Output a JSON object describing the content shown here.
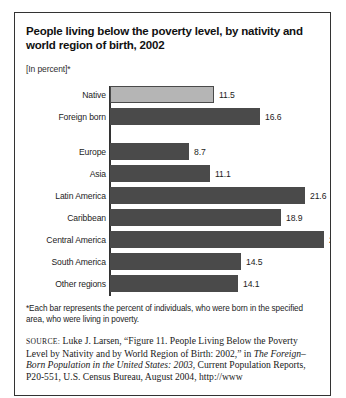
{
  "figure": {
    "title": "People living below the poverty level, by nativity and world region of birth, 2002",
    "subtitle": "[In percent]*",
    "footnote": "*Each bar represents the percent of individuals, who were born in the specified area, who were living in poverty.",
    "source": {
      "label": "SOURCE:",
      "part1": " Luke J. Larsen, “Figure 11. People Living Below the Poverty Level by Nativity and by World Region of Birth: 2002,” in ",
      "italic1": "The Foreign–Born Population in the United States: 2003",
      "part2": ", Current Population Reports, P20-551, U.S. Census Bureau, August 2004, http://www"
    }
  },
  "chart_data": {
    "type": "bar",
    "orientation": "horizontal",
    "title": "People living below the poverty level, by nativity and world region of birth, 2002",
    "xlabel": "",
    "ylabel": "",
    "unit": "percent",
    "xlim": [
      0,
      25
    ],
    "grid": false,
    "legend": "none",
    "categories": [
      "Native",
      "Foreign born",
      "Europe",
      "Asia",
      "Latin America",
      "Caribbean",
      "Central America",
      "South America",
      "Other regions"
    ],
    "values": [
      11.5,
      16.6,
      8.7,
      11.1,
      21.6,
      18.9,
      23.6,
      14.5,
      14.1
    ],
    "bars": [
      {
        "label": "Native",
        "value": 11.5,
        "display": "11.5",
        "style": "light",
        "group": 0
      },
      {
        "label": "Foreign born",
        "value": 16.6,
        "display": "16.6",
        "style": "dark",
        "group": 0
      },
      {
        "label": "Europe",
        "value": 8.7,
        "display": "8.7",
        "style": "dark",
        "group": 1
      },
      {
        "label": "Asia",
        "value": 11.1,
        "display": "11.1",
        "style": "dark",
        "group": 1
      },
      {
        "label": "Latin America",
        "value": 21.6,
        "display": "21.6",
        "style": "dark",
        "group": 1
      },
      {
        "label": "Caribbean",
        "value": 18.9,
        "display": "18.9",
        "style": "dark",
        "group": 1
      },
      {
        "label": "Central America",
        "value": 23.6,
        "display": "23.6",
        "style": "dark",
        "group": 1
      },
      {
        "label": "South America",
        "value": 14.5,
        "display": "14.5",
        "style": "dark",
        "group": 1
      },
      {
        "label": "Other regions",
        "value": 14.1,
        "display": "14.1",
        "style": "dark",
        "group": 1
      }
    ],
    "colors": {
      "bar_dark": "#4a4a4a",
      "bar_light": "#b5b5b5",
      "axis": "#333333",
      "text": "#1c1c1c"
    }
  }
}
